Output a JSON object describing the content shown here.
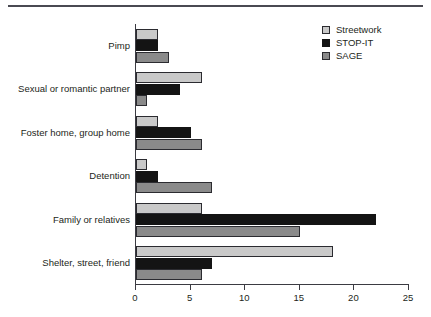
{
  "figure": {
    "top_rule": "horizontal-rule"
  },
  "chart_data": {
    "type": "bar",
    "orientation": "horizontal",
    "title": "",
    "subtitle": "",
    "xlabel": "",
    "ylabel": "",
    "xlim": [
      0,
      25
    ],
    "xticks": [
      0,
      5,
      10,
      15,
      20,
      25
    ],
    "xtick_labels": [
      "0",
      "5",
      "10",
      "15",
      "20",
      "25"
    ],
    "grid": false,
    "legend_position": "top-right",
    "categories": [
      "Pimp",
      "Sexual or romantic partner",
      "Foster home, group home",
      "Detention",
      "Family or relatives",
      "Shelter, street, friend"
    ],
    "series": [
      {
        "name": "Streetwork",
        "color": "#c9c9c9",
        "values": [
          2,
          6,
          2,
          1,
          6,
          18
        ]
      },
      {
        "name": "STOP-IT",
        "color": "#141414",
        "values": [
          2,
          4,
          5,
          2,
          22,
          7
        ]
      },
      {
        "name": "SAGE",
        "color": "#8a8a8a",
        "values": [
          3,
          1,
          6,
          7,
          15,
          6
        ]
      }
    ]
  }
}
